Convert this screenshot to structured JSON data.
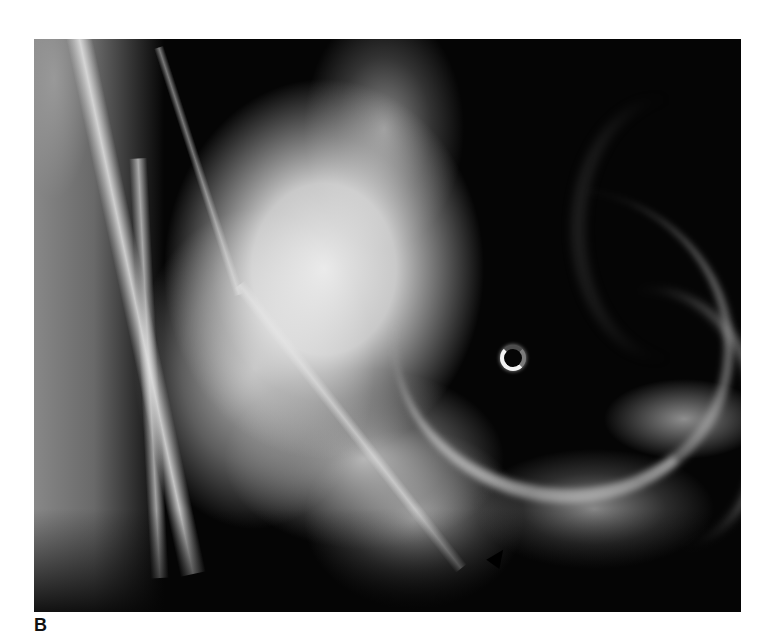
{
  "figure": {
    "panel_label": "B",
    "image": {
      "kind": "radiograph",
      "description": "Grayscale X-ray showing a bright irregular mass in the upper-left/center against a dark cavity on the right, with a ring marker and a black arrow marker near the bottom center",
      "markers": [
        {
          "type": "ring-marker",
          "position": "center-right"
        },
        {
          "type": "arrow-marker",
          "position": "bottom-center"
        }
      ],
      "colors": {
        "background": "#050505",
        "bright_tissue": "#f0f0f0",
        "page": "#ffffff"
      }
    }
  }
}
